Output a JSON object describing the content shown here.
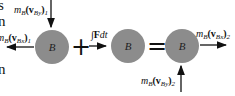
{
  "left_text_fragments": [
    "s",
    "n",
    "n"
  ],
  "diagram": {
    "ball_label": "B",
    "ball_color": "#8c8c8c",
    "operators": {
      "plus": "+",
      "equals": "="
    },
    "labels": {
      "momentum_y1": {
        "m": "m",
        "sub_m": "B",
        "v": "(v",
        "sub_v": "By",
        "close": ")",
        "sub_i": "1"
      },
      "momentum_x1": {
        "m": "m",
        "sub_m": "B",
        "v": "(v",
        "sub_v": "Bx",
        "close": ")",
        "sub_i": "1"
      },
      "impulse": {
        "int": "∫",
        "F": "F",
        "dt": "dt"
      },
      "momentum_x2": {
        "m": "m",
        "sub_m": "B",
        "v": "(v",
        "sub_v": "Bx",
        "close": ")",
        "sub_i": "2"
      },
      "momentum_y2": {
        "m": "m",
        "sub_m": "B",
        "v": "(v",
        "sub_v": "By",
        "close": ")",
        "sub_i": "2"
      }
    }
  }
}
